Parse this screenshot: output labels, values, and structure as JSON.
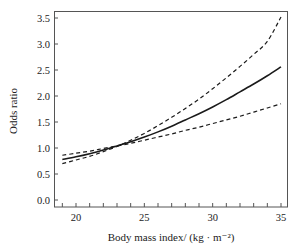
{
  "chart_data": {
    "type": "line",
    "title": "",
    "xlabel": "Body mass index/ (kg · m⁻²)",
    "ylabel": "Odds ratio",
    "xlim": [
      18.5,
      35.4
    ],
    "ylim": [
      -0.15,
      3.65
    ],
    "x_ticks": [
      20,
      25,
      30,
      35
    ],
    "x_tick_labels": [
      "20",
      "25",
      "30",
      "35"
    ],
    "y_ticks": [
      0.0,
      0.5,
      1.0,
      1.5,
      2.0,
      2.5,
      3.0,
      3.5
    ],
    "y_tick_labels": [
      "0.0",
      "0.5",
      "1.0",
      "1.5",
      "2.0",
      "2.5",
      "3.0",
      "3.5"
    ],
    "grid": false,
    "legend": null,
    "x": [
      19,
      20,
      21,
      22,
      23,
      24,
      25,
      26,
      27,
      28,
      29,
      30,
      31,
      32,
      33,
      34,
      35
    ],
    "series": [
      {
        "name": "Odds ratio",
        "style": "solid",
        "values": [
          0.78,
          0.83,
          0.89,
          0.96,
          1.04,
          1.12,
          1.21,
          1.31,
          1.42,
          1.54,
          1.66,
          1.79,
          1.93,
          2.08,
          2.23,
          2.39,
          2.56
        ]
      },
      {
        "name": "Upper 95% CI",
        "style": "dashed",
        "values": [
          0.7,
          0.77,
          0.84,
          0.93,
          1.03,
          1.15,
          1.28,
          1.43,
          1.59,
          1.76,
          1.94,
          2.14,
          2.35,
          2.57,
          2.8,
          3.05,
          3.52
        ]
      },
      {
        "name": "Lower 95% CI",
        "style": "dashed",
        "values": [
          0.86,
          0.9,
          0.94,
          0.99,
          1.04,
          1.09,
          1.15,
          1.21,
          1.27,
          1.34,
          1.4,
          1.47,
          1.54,
          1.61,
          1.69,
          1.77,
          1.85
        ]
      }
    ],
    "colors": {
      "line": "#1a1a1a",
      "axis": "#555555"
    }
  }
}
